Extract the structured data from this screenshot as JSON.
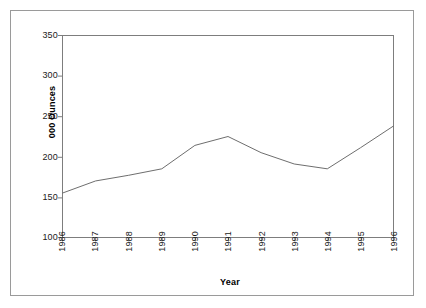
{
  "chart_data": {
    "type": "line",
    "title": "",
    "xlabel": "Year",
    "ylabel": "000 Ounces",
    "categories": [
      "1986",
      "1987",
      "1988",
      "1989",
      "1990",
      "1991",
      "1992",
      "1993",
      "1994",
      "1995",
      "1996"
    ],
    "x": [
      1986,
      1987,
      1988,
      1989,
      1990,
      1991,
      1992,
      1993,
      1994,
      1995,
      1996
    ],
    "values": [
      155,
      170,
      177,
      185,
      214,
      225,
      205,
      191,
      185,
      211,
      238
    ],
    "series": [
      {
        "name": "000 Ounces",
        "values": [
          155,
          170,
          177,
          185,
          214,
          225,
          205,
          191,
          185,
          211,
          238
        ]
      }
    ],
    "ylim": [
      100,
      350
    ],
    "yticks": [
      100,
      150,
      200,
      250,
      300,
      350
    ],
    "ytick_labels": [
      "100",
      "150",
      "200",
      "250",
      "300",
      "350"
    ],
    "xlim": [
      1986,
      1996
    ],
    "grid": false,
    "legend": "none",
    "line_color": "#6e6e6e",
    "frame_color": "#7d7d7d",
    "axis_label_color": "#1a1a1a"
  },
  "axes": {
    "y_title": "000 Ounces",
    "x_title": "Year"
  },
  "frame": {
    "border_color": "#9a9a9a",
    "background": "#ffffff"
  }
}
